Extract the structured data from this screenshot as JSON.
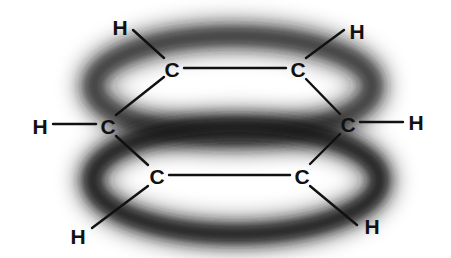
{
  "diagram": {
    "title": "",
    "colors": {
      "background": "#ffffff",
      "ink": "#111111",
      "cloud": "#1a1a1a"
    },
    "clouds": [
      {
        "id": "upper-pi-cloud",
        "cx": 233,
        "cy": 86,
        "rx": 140,
        "ry": 50
      },
      {
        "id": "lower-pi-cloud",
        "cx": 236,
        "cy": 180,
        "rx": 144,
        "ry": 54
      }
    ],
    "atoms": [
      {
        "id": "c1",
        "element": "C",
        "label": "C",
        "x": 172,
        "y": 69
      },
      {
        "id": "c2",
        "element": "C",
        "label": "C",
        "x": 298,
        "y": 69
      },
      {
        "id": "c3",
        "element": "C",
        "label": "C",
        "x": 348,
        "y": 124
      },
      {
        "id": "c4",
        "element": "C",
        "label": "C",
        "x": 302,
        "y": 176
      },
      {
        "id": "c5",
        "element": "C",
        "label": "C",
        "x": 157,
        "y": 176
      },
      {
        "id": "c6",
        "element": "C",
        "label": "C",
        "x": 108,
        "y": 126
      },
      {
        "id": "h1",
        "element": "H",
        "label": "H",
        "x": 120,
        "y": 27
      },
      {
        "id": "h2",
        "element": "H",
        "label": "H",
        "x": 357,
        "y": 31
      },
      {
        "id": "h3",
        "element": "H",
        "label": "H",
        "x": 416,
        "y": 122
      },
      {
        "id": "h4",
        "element": "H",
        "label": "H",
        "x": 372,
        "y": 226
      },
      {
        "id": "h5",
        "element": "H",
        "label": "H",
        "x": 78,
        "y": 236
      },
      {
        "id": "h6",
        "element": "H",
        "label": "H",
        "x": 40,
        "y": 126
      }
    ],
    "bonds": [
      {
        "from": "c1",
        "to": "c2",
        "x1": 184,
        "y1": 68,
        "x2": 286,
        "y2": 68
      },
      {
        "from": "c2",
        "to": "c3",
        "x1": 306,
        "y1": 79,
        "x2": 340,
        "y2": 114
      },
      {
        "from": "c3",
        "to": "c4",
        "x1": 340,
        "y1": 134,
        "x2": 310,
        "y2": 164
      },
      {
        "from": "c4",
        "to": "c5",
        "x1": 290,
        "y1": 175,
        "x2": 169,
        "y2": 175
      },
      {
        "from": "c5",
        "to": "c6",
        "x1": 148,
        "y1": 165,
        "x2": 116,
        "y2": 136
      },
      {
        "from": "c6",
        "to": "c1",
        "x1": 116,
        "y1": 115,
        "x2": 164,
        "y2": 77
      },
      {
        "from": "c1",
        "to": "h1",
        "x1": 164,
        "y1": 58,
        "x2": 133,
        "y2": 30
      },
      {
        "from": "c2",
        "to": "h2",
        "x1": 306,
        "y1": 58,
        "x2": 344,
        "y2": 30
      },
      {
        "from": "c3",
        "to": "h3",
        "x1": 360,
        "y1": 122,
        "x2": 403,
        "y2": 122
      },
      {
        "from": "c4",
        "to": "h4",
        "x1": 310,
        "y1": 186,
        "x2": 357,
        "y2": 225
      },
      {
        "from": "c5",
        "to": "h5",
        "x1": 148,
        "y1": 186,
        "x2": 92,
        "y2": 228
      },
      {
        "from": "c6",
        "to": "h6",
        "x1": 96,
        "y1": 124,
        "x2": 53,
        "y2": 124
      }
    ]
  }
}
